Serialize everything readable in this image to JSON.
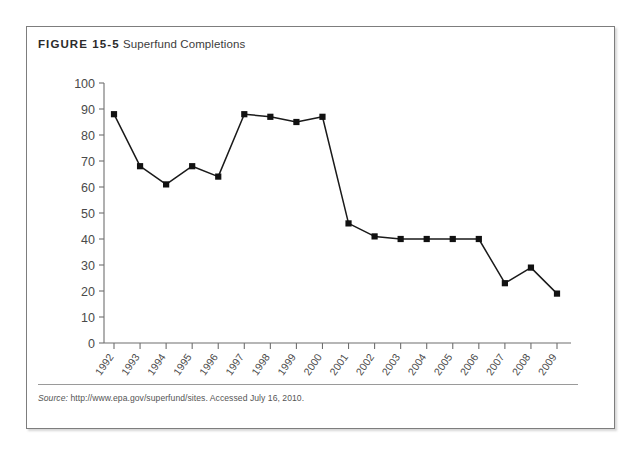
{
  "figure": {
    "label": "FIGURE 15-5",
    "caption": "Superfund Completions",
    "source_label": "Source:",
    "source_text": "http://www.epa.gov/superfund/sites. Accessed July 16, 2010."
  },
  "colors": {
    "line": "#1a1a1a",
    "marker": "#111111",
    "axis": "#6f6f6f",
    "tick_text": "#4a4a4a",
    "border": "#7d7d7d",
    "rule": "#9a9a9a"
  },
  "chart_data": {
    "type": "line",
    "title": "Superfund Completions",
    "xlabel": "",
    "ylabel": "",
    "categories": [
      "1992",
      "1993",
      "1994",
      "1995",
      "1996",
      "1997",
      "1998",
      "1999",
      "2000",
      "2001",
      "2002",
      "2003",
      "2004",
      "2005",
      "2006",
      "2007",
      "2008",
      "2009"
    ],
    "values": [
      88,
      68,
      61,
      68,
      64,
      88,
      87,
      85,
      87,
      46,
      41,
      40,
      40,
      40,
      40,
      23,
      29,
      19
    ],
    "ylim": [
      0,
      100
    ],
    "yticks": [
      0,
      10,
      20,
      30,
      40,
      50,
      60,
      70,
      80,
      90,
      100
    ],
    "ytick_labels": [
      "0",
      "10",
      "20",
      "30",
      "40",
      "50",
      "60",
      "70",
      "80",
      "90",
      "100"
    ],
    "grid": false,
    "legend": false,
    "marker": "square"
  }
}
